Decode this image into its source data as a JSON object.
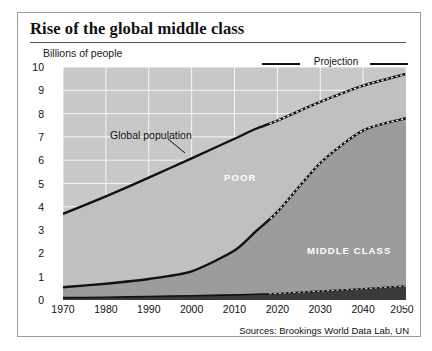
{
  "title": "Rise of the global middle class",
  "axis": {
    "ylabel": "Billions of people",
    "yticks": [
      "10",
      "9",
      "8",
      "7",
      "6",
      "5",
      "4",
      "3",
      "2",
      "1",
      "0"
    ],
    "xticks": [
      "1970",
      "1980",
      "1990",
      "2000",
      "2010",
      "2020",
      "2030",
      "2040",
      "2050"
    ]
  },
  "legend": {
    "projection_label": "Projection"
  },
  "annotations": {
    "global_population": "Global population",
    "poor": "POOR",
    "middle_class": "MIDDLE CLASS",
    "rich": "RICH"
  },
  "source": "Sources: Brookings World Data Lab, UN",
  "colors": {
    "band_poor": "#c0c0c0",
    "band_middle": "#9c9c9c",
    "band_rich": "#3a3a3a",
    "line": "#111111",
    "grid": "#ffffff",
    "frame": "#9a9a9a"
  },
  "chart_data": {
    "type": "area",
    "title": "Rise of the global middle class",
    "subtitle": "Billions of people",
    "xlabel": "",
    "ylabel": "Billions of people",
    "xlim": [
      1970,
      2050
    ],
    "ylim": [
      0,
      10
    ],
    "grid": true,
    "legend_position": "top-right",
    "projection_starts": 2018,
    "stacking": "bottom-up: rich, middle class, poor (sums to global population)",
    "x": [
      1970,
      1980,
      1990,
      2000,
      2010,
      2015,
      2020,
      2030,
      2040,
      2050
    ],
    "series": [
      {
        "name": "Rich",
        "values": [
          0.1,
          0.12,
          0.15,
          0.18,
          0.22,
          0.25,
          0.28,
          0.38,
          0.48,
          0.6
        ]
      },
      {
        "name": "Middle class",
        "values": [
          0.45,
          0.58,
          0.75,
          1.05,
          1.9,
          2.7,
          3.5,
          5.5,
          6.8,
          7.2
        ]
      },
      {
        "name": "Poor",
        "values": [
          3.15,
          3.75,
          4.35,
          4.85,
          4.8,
          4.4,
          3.92,
          2.62,
          1.92,
          1.9
        ]
      }
    ],
    "cumulative": [
      {
        "name": "Rich (top of band)",
        "values": [
          0.1,
          0.12,
          0.15,
          0.18,
          0.22,
          0.25,
          0.28,
          0.38,
          0.48,
          0.6
        ]
      },
      {
        "name": "Rich + Middle class",
        "values": [
          0.55,
          0.7,
          0.9,
          1.23,
          2.12,
          2.95,
          3.78,
          5.88,
          7.28,
          7.8
        ]
      },
      {
        "name": "Global population (total)",
        "values": [
          3.7,
          4.45,
          5.25,
          6.08,
          6.92,
          7.35,
          7.7,
          8.5,
          9.2,
          9.7
        ]
      }
    ],
    "annotations": [
      {
        "text": "Global population",
        "points_to": "total population line"
      },
      {
        "text": "POOR",
        "region": "upper band"
      },
      {
        "text": "MIDDLE CLASS",
        "region": "middle band"
      },
      {
        "text": "RICH",
        "region": "bottom band"
      },
      {
        "text": "Projection",
        "region": "from 2018 onward, dashed overlay"
      }
    ]
  }
}
